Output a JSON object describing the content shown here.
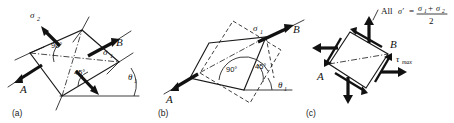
{
  "figure": {
    "background_color": "#ffffff",
    "ink_color": "#1a1a1a",
    "width": 454,
    "height": 123
  },
  "panels": [
    {
      "id": "a",
      "caption": "(a)",
      "labels": {
        "sigma2": "σ",
        "sigma2_sub": "2",
        "sigma1": "σ",
        "sigma1_sub": "1",
        "point_a": "A",
        "point_b": "B",
        "angle_90": "90°",
        "angle_45": "45°",
        "theta": "θ",
        "theta_sub": "1"
      }
    },
    {
      "id": "b",
      "caption": "(b)",
      "labels": {
        "sigma1": "σ",
        "sigma1_sub": "1",
        "point_a": "A",
        "point_b": "B",
        "angle_90": "90°",
        "angle_45": "45°",
        "theta": "θ",
        "theta_sub": "1"
      }
    },
    {
      "id": "c",
      "caption": "(c)",
      "labels": {
        "formula_prefix": "All",
        "formula_sigma_prime": "σ′",
        "formula_equals": "=",
        "formula_numerator_s1": "σ",
        "formula_numerator_s1_sub": "1",
        "formula_plus": "+",
        "formula_numerator_s2": "σ",
        "formula_numerator_s2_sub": "2",
        "formula_denominator": "2",
        "tau_max": "τ",
        "tau_max_sub": "max",
        "point_a": "A",
        "point_b": "B"
      }
    }
  ]
}
